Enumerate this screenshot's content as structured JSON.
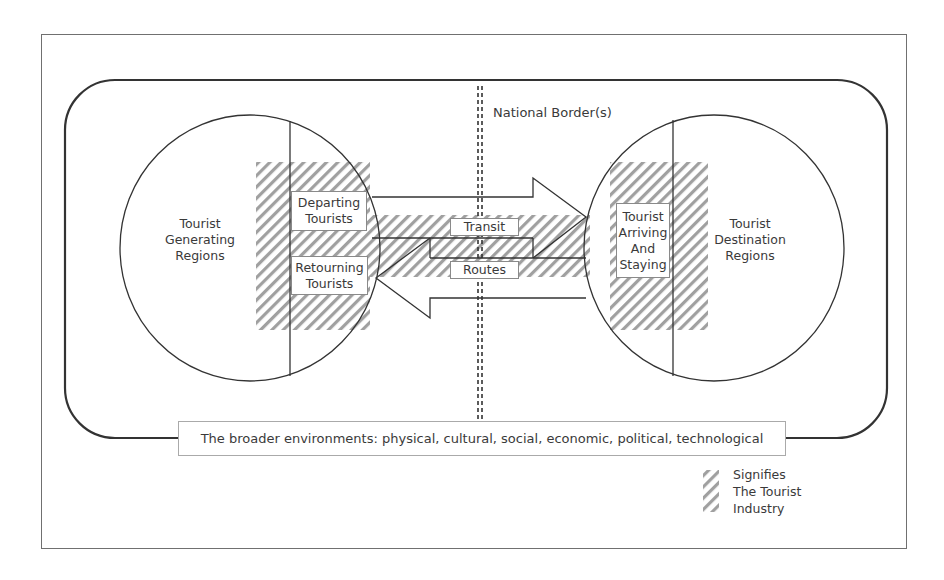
{
  "diagram": {
    "border_label": "National Border(s)",
    "generating_region": {
      "label_lines": [
        "Tourist",
        "Generating",
        "Regions"
      ]
    },
    "destination_region": {
      "label_lines": [
        "Tourist",
        "Destination",
        "Regions"
      ]
    },
    "departing_box": {
      "lines": [
        "Departing",
        "Tourists"
      ]
    },
    "returning_box": {
      "lines": [
        "Retourning",
        "Tourists"
      ]
    },
    "arriving_box": {
      "lines": [
        "Tourist",
        "Arriving",
        "And",
        "Staying"
      ]
    },
    "transit_label": "Transit",
    "routes_label": "Routes",
    "environment_label": "The broader environments: physical, cultural, social, economic, political, technological",
    "legend": {
      "lines": [
        "Signifies",
        "The Tourist",
        "Industry"
      ],
      "pattern": "diagonal-hatch"
    },
    "colors": {
      "line": "#333333",
      "hatch": "#9a9a9a",
      "text": "#3a3a3a",
      "frame": "#666666"
    }
  }
}
